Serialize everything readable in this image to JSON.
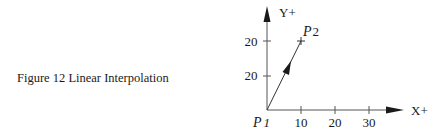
{
  "caption": {
    "figure_number": "Figure 12",
    "title": "Linear Interpolation",
    "full": "Figure 12  Linear Interpolation"
  },
  "axes": {
    "x_label": "X+",
    "y_label": "Y+",
    "x_ticks": [
      "10",
      "20",
      "30"
    ],
    "y_ticks": [
      "10",
      "20"
    ]
  },
  "points": {
    "start": {
      "label": "P",
      "subscript": "1",
      "x": 0,
      "y": 0
    },
    "end": {
      "label": "P",
      "subscript": "2",
      "x": 10,
      "y": 20
    }
  },
  "colors": {
    "ink": "#1a1a1a",
    "axis": "#555555",
    "background": "#ffffff"
  }
}
